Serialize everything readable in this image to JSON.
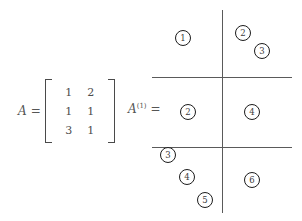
{
  "figure": {
    "width": 302,
    "height": 221,
    "background_color": "#ffffff"
  },
  "matrix_equation": {
    "label": "A",
    "equals": "=",
    "bracket_style": "square",
    "rows": [
      [
        "1",
        "2"
      ],
      [
        "1",
        "1"
      ],
      [
        "3",
        "1"
      ]
    ]
  },
  "a1_equation": {
    "label": "A",
    "superscript": "(1)",
    "equals": "="
  },
  "grid": {
    "vertical_lines": [
      {
        "name": "column-divider",
        "x": 222,
        "y_start": 10,
        "y_end": 213
      }
    ],
    "horizontal_lines": [
      {
        "name": "row-divider-top",
        "y": 77,
        "x_start": 152,
        "x_end": 292
      },
      {
        "name": "row-divider-bottom",
        "y": 147,
        "x_start": 152,
        "x_end": 292
      }
    ],
    "line_color": "#5a5a5a",
    "rows": 3,
    "columns": 2
  },
  "circled_numbers": [
    {
      "label": "1",
      "cell": "row1-col1",
      "x": 175,
      "y": 30
    },
    {
      "label": "2",
      "cell": "row1-col2",
      "x": 235,
      "y": 25
    },
    {
      "label": "3",
      "cell": "row1-col2",
      "x": 254,
      "y": 43
    },
    {
      "label": "2",
      "cell": "row2-col1",
      "x": 180,
      "y": 104
    },
    {
      "label": "4",
      "cell": "row2-col2",
      "x": 244,
      "y": 104
    },
    {
      "label": "3",
      "cell": "row3-col1",
      "x": 160,
      "y": 147
    },
    {
      "label": "4",
      "cell": "row3-col1",
      "x": 179,
      "y": 169
    },
    {
      "label": "5",
      "cell": "row3-col1",
      "x": 197,
      "y": 192
    },
    {
      "label": "6",
      "cell": "row3-col2",
      "x": 244,
      "y": 172
    }
  ]
}
